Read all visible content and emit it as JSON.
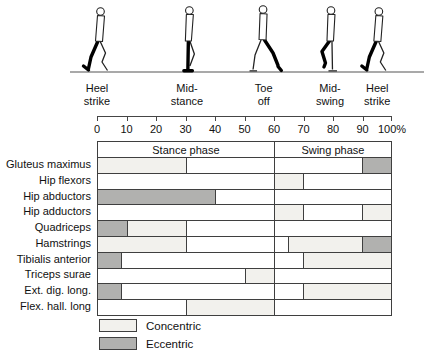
{
  "gait_figures": {
    "phases": [
      {
        "line1": "Heel",
        "line2": "strike",
        "pos_pct": 0,
        "pose": "heel_strike"
      },
      {
        "line1": "Mid-",
        "line2": "stance",
        "pos_pct": 30.5,
        "pose": "mid_stance"
      },
      {
        "line1": "Toe",
        "line2": "off",
        "pos_pct": 56.5,
        "pose": "toe_off"
      },
      {
        "line1": "Mid-",
        "line2": "swing",
        "pos_pct": 79,
        "pose": "mid_swing"
      },
      {
        "line1": "Heel",
        "line2": "strike",
        "pos_pct": 95,
        "pose": "heel_strike"
      }
    ]
  },
  "axis": {
    "ticks": [
      {
        "label": "0",
        "pos": 0
      },
      {
        "label": "10",
        "pos": 10
      },
      {
        "label": "20",
        "pos": 20
      },
      {
        "label": "30",
        "pos": 30
      },
      {
        "label": "40",
        "pos": 40
      },
      {
        "label": "50",
        "pos": 50
      },
      {
        "label": "60",
        "pos": 60
      },
      {
        "label": "70",
        "pos": 70
      },
      {
        "label": "80",
        "pos": 80
      },
      {
        "label": "90",
        "pos": 90
      },
      {
        "label": "100%",
        "pos": 100
      }
    ]
  },
  "chart_data": {
    "type": "table",
    "x_unit": "% of gait cycle",
    "x_range": [
      0,
      100
    ],
    "phase_headers": [
      {
        "label": "Stance phase",
        "start": 0,
        "end": 60
      },
      {
        "label": "Swing phase",
        "start": 60,
        "end": 100
      }
    ],
    "activity_colors": {
      "none": "#ffffff",
      "concentric": "#f2f1ed",
      "eccentric": "#b1b1af"
    },
    "muscles": [
      {
        "name": "Gluteus maximus",
        "segments": [
          {
            "start": 0,
            "end": 30,
            "activity": "concentric"
          },
          {
            "start": 30,
            "end": 60,
            "activity": "none"
          },
          {
            "start": 60,
            "end": 90,
            "activity": "none"
          },
          {
            "start": 90,
            "end": 100,
            "activity": "eccentric"
          }
        ]
      },
      {
        "name": "Hip flexors",
        "segments": [
          {
            "start": 0,
            "end": 60,
            "activity": "none"
          },
          {
            "start": 60,
            "end": 70,
            "activity": "concentric"
          },
          {
            "start": 70,
            "end": 100,
            "activity": "none"
          }
        ]
      },
      {
        "name": "Hip abductors",
        "segments": [
          {
            "start": 0,
            "end": 40,
            "activity": "eccentric"
          },
          {
            "start": 40,
            "end": 60,
            "activity": "none"
          },
          {
            "start": 60,
            "end": 100,
            "activity": "none"
          }
        ]
      },
      {
        "name": "Hip adductors",
        "segments": [
          {
            "start": 0,
            "end": 60,
            "activity": "none"
          },
          {
            "start": 60,
            "end": 70,
            "activity": "concentric"
          },
          {
            "start": 70,
            "end": 90,
            "activity": "none"
          },
          {
            "start": 90,
            "end": 100,
            "activity": "concentric"
          }
        ]
      },
      {
        "name": "Quadriceps",
        "segments": [
          {
            "start": 0,
            "end": 10,
            "activity": "eccentric"
          },
          {
            "start": 10,
            "end": 30,
            "activity": "concentric"
          },
          {
            "start": 30,
            "end": 60,
            "activity": "none"
          },
          {
            "start": 60,
            "end": 100,
            "activity": "none"
          }
        ]
      },
      {
        "name": "Hamstrings",
        "segments": [
          {
            "start": 0,
            "end": 30,
            "activity": "concentric"
          },
          {
            "start": 30,
            "end": 60,
            "activity": "none"
          },
          {
            "start": 60,
            "end": 65,
            "activity": "none"
          },
          {
            "start": 65,
            "end": 90,
            "activity": "concentric"
          },
          {
            "start": 90,
            "end": 100,
            "activity": "eccentric"
          }
        ]
      },
      {
        "name": "Tibialis anterior",
        "segments": [
          {
            "start": 0,
            "end": 8,
            "activity": "eccentric"
          },
          {
            "start": 8,
            "end": 60,
            "activity": "none"
          },
          {
            "start": 60,
            "end": 70,
            "activity": "none"
          },
          {
            "start": 70,
            "end": 100,
            "activity": "concentric"
          }
        ]
      },
      {
        "name": "Triceps surae",
        "segments": [
          {
            "start": 0,
            "end": 50,
            "activity": "none"
          },
          {
            "start": 50,
            "end": 60,
            "activity": "concentric"
          },
          {
            "start": 60,
            "end": 100,
            "activity": "none"
          }
        ]
      },
      {
        "name": "Ext. dig. long.",
        "segments": [
          {
            "start": 0,
            "end": 8,
            "activity": "eccentric"
          },
          {
            "start": 8,
            "end": 60,
            "activity": "none"
          },
          {
            "start": 60,
            "end": 70,
            "activity": "none"
          },
          {
            "start": 70,
            "end": 100,
            "activity": "concentric"
          }
        ]
      },
      {
        "name": "Flex. hall. long",
        "segments": [
          {
            "start": 0,
            "end": 30,
            "activity": "none"
          },
          {
            "start": 30,
            "end": 60,
            "activity": "concentric"
          },
          {
            "start": 60,
            "end": 100,
            "activity": "none"
          }
        ]
      }
    ]
  },
  "legend": {
    "items": [
      {
        "label": "Concentric",
        "type": "concentric"
      },
      {
        "label": "Eccentric",
        "type": "eccentric"
      }
    ]
  },
  "colors": {
    "concentric": "#f2f1ed",
    "eccentric": "#b1b1af",
    "grid": "#3f3f3f",
    "background": "#ffffff",
    "text": "#111111"
  }
}
